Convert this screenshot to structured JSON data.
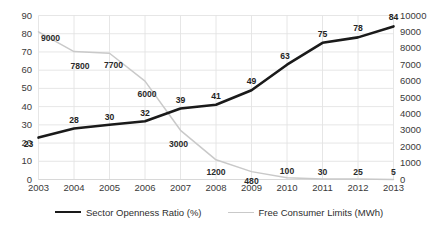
{
  "chart_data": {
    "type": "line",
    "title": "",
    "subtitle": "",
    "xlabel": "",
    "ylabel": "",
    "grid": true,
    "legend_position": "bottom",
    "categories": [
      "2003",
      "2004",
      "2005",
      "2006",
      "2007",
      "2008",
      "2009",
      "2010",
      "2011",
      "2012",
      "2013"
    ],
    "series": [
      {
        "name": "Sector Openness Ratio (%)",
        "axis": "left",
        "color": "#1a1a1a",
        "line_width": 2.6,
        "values": [
          23,
          28,
          30,
          32,
          39,
          41,
          49,
          63,
          75,
          78,
          84
        ],
        "data_labels": [
          "23",
          "28",
          "30",
          "32",
          "39",
          "41",
          "49",
          "63",
          "75",
          "78",
          "84"
        ]
      },
      {
        "name": "Free Consumer Limits (MWh)",
        "axis": "right",
        "color": "#c9c9c9",
        "line_width": 1.5,
        "values": [
          9000,
          7800,
          7700,
          6000,
          3000,
          1200,
          480,
          100,
          30,
          25,
          5
        ],
        "data_labels": [
          "9000",
          "7800",
          "7700",
          "6000",
          "3000",
          "1200",
          "480",
          "100",
          "30",
          "25",
          "5"
        ]
      }
    ],
    "left_axis": {
      "min": 0,
      "max": 90,
      "step": 10,
      "ticks": [
        "0",
        "10",
        "20",
        "30",
        "40",
        "50",
        "60",
        "70",
        "80",
        "90"
      ]
    },
    "right_axis": {
      "min": 0,
      "max": 10000,
      "step": 1000,
      "ticks": [
        "0",
        "1000",
        "2000",
        "3000",
        "4000",
        "5000",
        "6000",
        "7000",
        "8000",
        "9000",
        "10000"
      ]
    }
  },
  "legend": {
    "entries": [
      {
        "label": "Sector Openness Ratio (%)",
        "style": "thick-dark"
      },
      {
        "label": "Free Consumer Limits (MWh)",
        "style": "thin-light"
      }
    ]
  },
  "colors": {
    "series_dark": "#1a1a1a",
    "series_light": "#c9c9c9",
    "grid": "#e3e3e3",
    "text": "#2e2e2e",
    "background": "#ffffff"
  }
}
